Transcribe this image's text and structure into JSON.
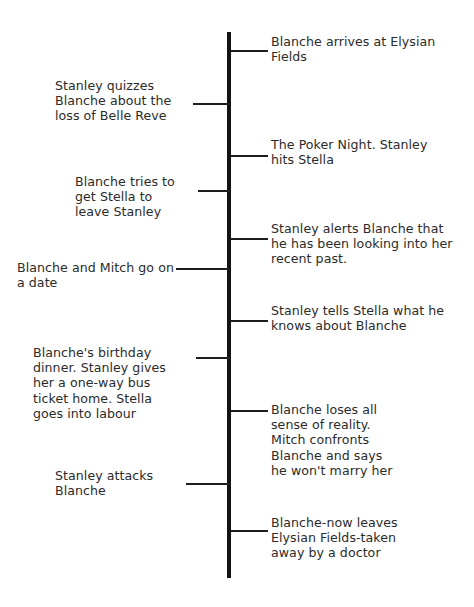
{
  "diagram": {
    "type": "vertical-timeline",
    "axis_color": "#141414",
    "text_color": "#2b2b2b",
    "background": "#ffffff"
  },
  "events_right": [
    {
      "id": "event-r1",
      "text": "Blanche arrives at Elysian\nFields",
      "tick_y": 50,
      "text_y": 34,
      "width": 195
    },
    {
      "id": "event-r2",
      "text": "The Poker Night. Stanley\nhits Stella",
      "tick_y": 155,
      "text_y": 137,
      "width": 195
    },
    {
      "id": "event-r3",
      "text": "Stanley alerts Blanche that\nhe has been looking into her\nrecent past.",
      "tick_y": 238,
      "text_y": 221,
      "width": 200
    },
    {
      "id": "event-r4",
      "text": "Stanley tells Stella what he\nknows about Blanche",
      "tick_y": 320,
      "text_y": 303,
      "width": 200
    },
    {
      "id": "event-r5",
      "text": "Blanche loses all\nsense of reality.\nMitch confronts\nBlanche and says\nhe won't marry her",
      "tick_y": 410,
      "text_y": 402,
      "width": 135
    },
    {
      "id": "event-r6",
      "text": "Blanche-now leaves\nElysian Fields-taken\naway by a doctor",
      "tick_y": 530,
      "text_y": 515,
      "width": 160
    }
  ],
  "events_left": [
    {
      "id": "event-l1",
      "text": "Stanley quizzes\nBlanche about the\nloss of Belle Reve",
      "tick_y": 103,
      "tick_width": 38,
      "text_y": 78,
      "text_left": 55,
      "width": 120
    },
    {
      "id": "event-l2",
      "text": "Blanche tries to\nget Stella to\nleave Stanley",
      "tick_y": 190,
      "tick_width": 33,
      "text_y": 174,
      "text_left": 75,
      "width": 105
    },
    {
      "id": "event-l3",
      "text": "Blanche and Mitch go on\na date",
      "tick_y": 268,
      "tick_width": 55,
      "text_y": 260,
      "text_left": 17,
      "width": 160
    },
    {
      "id": "event-l4",
      "text": "Blanche's birthday\ndinner. Stanley gives\nher a one-way bus\nticket home. Stella\ngoes into labour",
      "tick_y": 357,
      "tick_width": 35,
      "text_y": 345,
      "text_left": 33,
      "width": 135
    },
    {
      "id": "event-l5",
      "text": "Stanley attacks\nBlanche",
      "tick_y": 483,
      "tick_width": 45,
      "text_y": 468,
      "text_left": 55,
      "width": 115
    }
  ]
}
